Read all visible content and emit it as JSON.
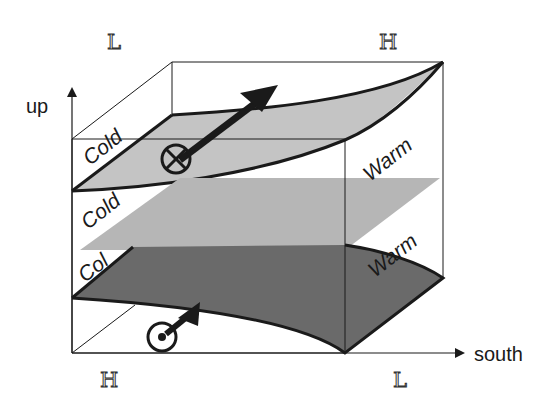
{
  "diagram": {
    "type": "3D schematic of frontal surfaces",
    "axes": {
      "vertical_label": "up",
      "horizontal_label": "south"
    },
    "pressure_labels": {
      "top_left": "L",
      "top_right": "H",
      "bottom_left": "H",
      "bottom_right": "L"
    },
    "surfaces": [
      {
        "name": "upper-surface",
        "cold_label": "Cold",
        "warm_label": "Warm",
        "fill": "#c4c4c4"
      },
      {
        "name": "middle-plane",
        "cold_label": "Cold",
        "warm_label": "",
        "fill": "#b6b6b6"
      },
      {
        "name": "lower-surface",
        "cold_label": "Col",
        "warm_label": "Warm",
        "fill": "#6c6c6c"
      }
    ],
    "symbols": [
      {
        "name": "into-page-symbol",
        "meaning": "flow into page (⊗)"
      },
      {
        "name": "out-of-page-symbol",
        "meaning": "flow out of page (⊙)"
      }
    ],
    "colors": {
      "line": "#1a1a1a",
      "upper_fill": "#c4c4c4",
      "middle_fill": "#b4b4b4",
      "lower_fill": "#686868"
    }
  }
}
